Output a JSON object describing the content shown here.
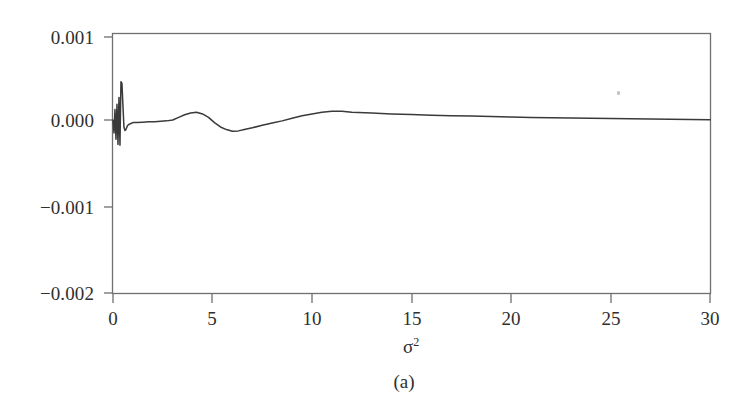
{
  "figure": {
    "panel_caption": "(a)",
    "ink_color": "#3a3a3a",
    "frame_color": "#6f6f6f",
    "background_color": "#ffffff"
  },
  "axes": {
    "x_title_symbol": "σ",
    "x_title_exponent": "2",
    "y_tick_labels": [
      "0.001",
      "0.000",
      "−0.001",
      "−0.002"
    ],
    "x_tick_labels": [
      "0",
      "5",
      "10",
      "15",
      "20",
      "25",
      "30"
    ]
  },
  "chart_data": {
    "type": "line",
    "title": "",
    "subtitle": "",
    "xlabel": "σ²",
    "ylabel": "",
    "xlim": [
      0,
      30
    ],
    "ylim": [
      -0.002,
      0.001
    ],
    "xticks": [
      0,
      5,
      10,
      15,
      20,
      25,
      30
    ],
    "yticks": [
      0.001,
      0.0,
      -0.001,
      -0.002
    ],
    "grid": false,
    "legend": null,
    "annotations": [],
    "series": [
      {
        "name": "error",
        "color": "#3a3a3a",
        "x": [
          0.0,
          0.05,
          0.1,
          0.15,
          0.2,
          0.25,
          0.3,
          0.35,
          0.4,
          0.45,
          0.5,
          0.55,
          0.6,
          0.65,
          0.7,
          0.75,
          0.8,
          0.9,
          1.0,
          1.2,
          1.5,
          1.8,
          2.1,
          2.4,
          2.7,
          3.0,
          3.3,
          3.6,
          3.9,
          4.2,
          4.5,
          4.8,
          5.1,
          5.4,
          5.7,
          6.0,
          6.3,
          6.6,
          7.0,
          7.5,
          8.0,
          8.5,
          9.0,
          9.5,
          10.0,
          10.5,
          11.0,
          11.5,
          12.0,
          13.0,
          14.0,
          15.0,
          16.0,
          17.0,
          18.0,
          19.0,
          20.0,
          21.0,
          22.0,
          23.0,
          24.0,
          25.0,
          26.0,
          27.0,
          28.0,
          29.0,
          30.0
        ],
        "y": [
          0.0,
          -0.00015,
          0.00012,
          -0.00022,
          0.00018,
          -0.00028,
          0.00026,
          -0.00029,
          0.00044,
          0.00042,
          0.00016,
          -8e-05,
          -0.00012,
          -0.00011,
          -8e-05,
          -6e-05,
          -5e-05,
          -4e-05,
          -3e-05,
          -3e-05,
          -2.5e-05,
          -2e-05,
          -2e-05,
          -1.5e-05,
          -1e-05,
          0.0,
          3e-05,
          6e-05,
          8e-05,
          9e-05,
          7e-05,
          3e-05,
          -3e-05,
          -8e-05,
          -0.00011,
          -0.00013,
          -0.000125,
          -0.00011,
          -9e-05,
          -6e-05,
          -3.5e-05,
          -1e-05,
          2e-05,
          5e-05,
          7e-05,
          9e-05,
          0.0001,
          0.0001,
          9e-05,
          8e-05,
          7e-05,
          6.2e-05,
          5.5e-05,
          5e-05,
          4.5e-05,
          4e-05,
          3.5e-05,
          3e-05,
          2.7e-05,
          2.4e-05,
          2e-05,
          1.7e-05,
          1.4e-05,
          1.1e-05,
          8e-06,
          5e-06,
          2e-06
        ]
      }
    ]
  }
}
